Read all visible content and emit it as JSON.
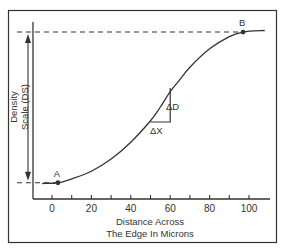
{
  "diagram": {
    "title": "",
    "y_axis_label_line1": "Density",
    "y_axis_label_line2": "Scale (DS)",
    "x_axis_label_line1": "Distance Across",
    "x_axis_label_line2": "The Edge In Microns",
    "delta_d_label": "ΔD",
    "delta_x_label": "ΔX",
    "colors": {
      "ink": "#333333",
      "background": "#ffffff"
    }
  },
  "chart_data": {
    "type": "line",
    "title": "",
    "xlabel": "Distance Across The Edge In Microns",
    "ylabel": "Density Scale (DS)",
    "xlim": [
      -10,
      110
    ],
    "ylim": [
      0,
      1
    ],
    "x_ticks": [
      0,
      20,
      40,
      60,
      80,
      100
    ],
    "x_tick_labels": [
      "0",
      "20",
      "40",
      "60",
      "80",
      "100"
    ],
    "x_minor_ticks": [
      10,
      30,
      50,
      70,
      90
    ],
    "grid": false,
    "series": [
      {
        "name": "edge density profile",
        "x": [
          -5,
          3,
          10,
          20,
          30,
          40,
          50,
          55,
          60,
          65,
          70,
          80,
          90,
          97,
          108
        ],
        "y": [
          0.0,
          0.005,
          0.03,
          0.08,
          0.16,
          0.27,
          0.41,
          0.5,
          0.6,
          0.68,
          0.76,
          0.88,
          0.96,
          0.99,
          1.0
        ]
      }
    ],
    "points": [
      {
        "label": "A",
        "x": 3,
        "y": 0.005
      },
      {
        "label": "B",
        "x": 97,
        "y": 0.99
      }
    ],
    "reference_lines": [
      {
        "type": "horizontal-dashed",
        "y": 0.99,
        "x_to": 97
      },
      {
        "type": "horizontal-dashed",
        "y": 0.005,
        "x_to": 3
      }
    ],
    "annotations": [
      {
        "type": "double-arrow",
        "from_y": 0.005,
        "to_y": 0.99,
        "label": "Density Scale (DS)"
      },
      {
        "type": "slope-triangle",
        "x0": 50,
        "x1": 60,
        "y0": 0.41,
        "y1": 0.6,
        "labels": [
          "ΔX",
          "ΔD"
        ]
      }
    ]
  }
}
